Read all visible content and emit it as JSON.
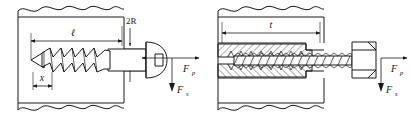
{
  "figure": {
    "background_color": "#ffffff",
    "line_color": "#1a1a1a"
  },
  "panels": [
    {
      "id": "left",
      "name": "wood-screw-panel",
      "caption": "Wood screw with round head embedded in material",
      "fastener_type": "wood-screw",
      "head_type": "round-slotted-head",
      "material": "solid-block-with-break-lines",
      "dimensions": [
        {
          "symbol": "ℓ",
          "name": "embedded-length",
          "meaning": "thread engagement length"
        },
        {
          "symbol": "x",
          "name": "thread-pitch",
          "meaning": "thread pitch spacing"
        },
        {
          "symbol": "2R",
          "name": "shank-diameter",
          "meaning": "screw shank diameter"
        }
      ],
      "forces": [
        {
          "symbol": "F",
          "subscript": "p",
          "name": "pullout-force",
          "direction": "right"
        },
        {
          "symbol": "F",
          "subscript": "s",
          "name": "shear-force",
          "direction": "down"
        }
      ],
      "thread_count": 5
    },
    {
      "id": "right",
      "name": "machine-bolt-panel",
      "caption": "Hex head bolt threaded into tapped hole, sectioned view",
      "fastener_type": "machine-bolt",
      "head_type": "hex-head",
      "material": "sectioned-block-hatched",
      "dimensions": [
        {
          "symbol": "t",
          "name": "material-thickness",
          "meaning": "thread engagement thickness"
        }
      ],
      "forces": [
        {
          "symbol": "F",
          "subscript": "p",
          "name": "pullout-force",
          "direction": "right"
        },
        {
          "symbol": "F",
          "subscript": "s",
          "name": "shear-force",
          "direction": "down"
        }
      ],
      "thread_count": 8
    }
  ],
  "labels": {
    "left_length": "ℓ",
    "left_pitch": "x",
    "left_diameter": "2R",
    "left_force_pull": "F",
    "left_force_pull_sub": "p",
    "left_force_shear": "F",
    "left_force_shear_sub": "s",
    "right_thickness": "t",
    "right_force_pull": "F",
    "right_force_pull_sub": "p",
    "right_force_shear": "F",
    "right_force_shear_sub": "s"
  }
}
